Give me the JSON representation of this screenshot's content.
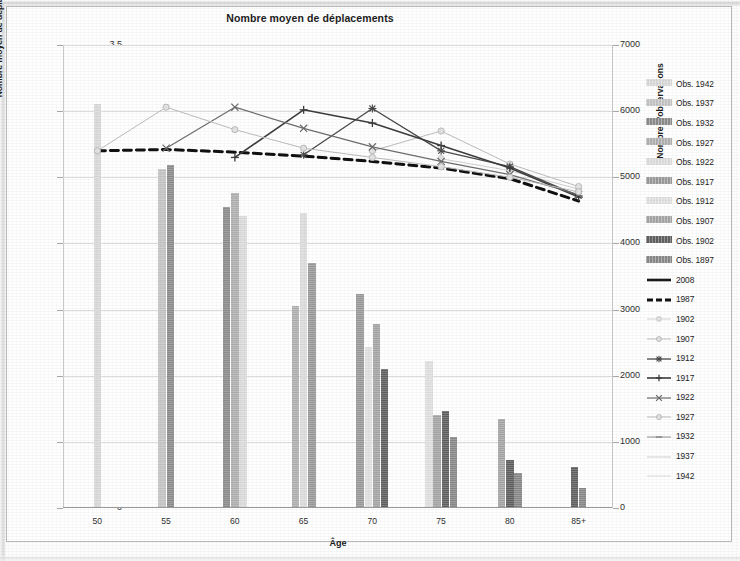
{
  "chart_data": {
    "type": "bar",
    "title": "Nombre moyen de déplacements",
    "xlabel": "Âge",
    "ylabel": "Nombre moyen de déplacements",
    "ylabel_secondary": "Nombre d'observations",
    "categories": [
      "50",
      "55",
      "60",
      "65",
      "70",
      "75",
      "80",
      "85+"
    ],
    "ylim": [
      0,
      3.5
    ],
    "yticks": [
      "0",
      "0,5",
      "1",
      "1,5",
      "2",
      "2,5",
      "3",
      "3,5"
    ],
    "ytick_values": [
      0,
      0.5,
      1,
      1.5,
      2,
      2.5,
      3,
      3.5
    ],
    "ylim_secondary": [
      0,
      7000
    ],
    "yticks_secondary": [
      "0",
      "1000",
      "2000",
      "3000",
      "4000",
      "5000",
      "6000",
      "7000"
    ],
    "ytick_values_secondary": [
      0,
      1000,
      2000,
      3000,
      4000,
      5000,
      6000,
      7000
    ],
    "grid": true,
    "legend_position": "right",
    "bar_axis": "secondary",
    "line_axis": "primary",
    "bar_series": [
      {
        "name": "Obs. 1942",
        "color": "#d9d9d9",
        "values": [
          6110,
          null,
          null,
          null,
          null,
          null,
          null,
          null
        ]
      },
      {
        "name": "Obs. 1937",
        "color": "#c4c4c4",
        "values": [
          null,
          5130,
          null,
          null,
          null,
          null,
          null,
          null
        ]
      },
      {
        "name": "Obs. 1932",
        "color": "#8c8c8c",
        "values": [
          null,
          5190,
          4550,
          null,
          null,
          null,
          null,
          null
        ]
      },
      {
        "name": "Obs. 1927",
        "color": "#b0b0b0",
        "values": [
          null,
          null,
          4760,
          3050,
          null,
          null,
          null,
          null
        ]
      },
      {
        "name": "Obs. 1922",
        "color": "#dcdcdc",
        "values": [
          null,
          null,
          4410,
          4460,
          null,
          null,
          null,
          null
        ]
      },
      {
        "name": "Obs. 1917",
        "color": "#9a9a9a",
        "values": [
          null,
          null,
          null,
          3700,
          3230,
          null,
          null,
          null
        ]
      },
      {
        "name": "Obs. 1912",
        "color": "#e0e0e0",
        "values": [
          null,
          null,
          null,
          null,
          2430,
          2220,
          null,
          null
        ]
      },
      {
        "name": "Obs. 1907",
        "color": "#a5a5a5",
        "values": [
          null,
          null,
          null,
          null,
          2780,
          1400,
          1340,
          null
        ]
      },
      {
        "name": "Obs. 1902",
        "color": "#5f5f5f",
        "values": [
          null,
          null,
          null,
          null,
          2100,
          1470,
          720,
          620
        ]
      },
      {
        "name": "Obs. 1897",
        "color": "#888888",
        "values": [
          null,
          null,
          null,
          null,
          null,
          1080,
          530,
          300
        ]
      }
    ],
    "line_series": [
      {
        "name": "2008",
        "color": "#1a1a1a",
        "style": "solid",
        "width": 2.4,
        "marker": "none",
        "values": [
          null,
          null,
          null,
          null,
          null,
          null,
          null,
          null
        ]
      },
      {
        "name": "1987",
        "color": "#111111",
        "style": "dashed",
        "width": 3.0,
        "marker": "none",
        "values": [
          2.7,
          2.71,
          2.69,
          2.66,
          2.62,
          2.57,
          2.49,
          2.32
        ]
      },
      {
        "name": "1902",
        "color": "#d0d0d0",
        "style": "solid",
        "width": 1.0,
        "marker": "circle",
        "values": [
          null,
          null,
          null,
          null,
          null,
          2.64,
          2.55,
          2.41
        ]
      },
      {
        "name": "1907",
        "color": "#bdbdbd",
        "style": "solid",
        "width": 1.0,
        "marker": "circle",
        "values": [
          null,
          null,
          null,
          null,
          2.7,
          2.85,
          2.6,
          2.43
        ]
      },
      {
        "name": "1912",
        "color": "#4a4a4a",
        "style": "solid",
        "width": 1.3,
        "marker": "star",
        "values": [
          null,
          null,
          null,
          2.67,
          3.02,
          2.7,
          2.58,
          2.36
        ]
      },
      {
        "name": "1917",
        "color": "#3d3d3d",
        "style": "solid",
        "width": 1.6,
        "marker": "plus",
        "values": [
          null,
          null,
          2.65,
          3.01,
          2.91,
          2.74,
          2.57,
          2.35
        ]
      },
      {
        "name": "1922",
        "color": "#6e6e6e",
        "style": "solid",
        "width": 1.2,
        "marker": "x",
        "values": [
          null,
          2.72,
          3.03,
          2.87,
          2.73,
          2.62,
          2.52,
          2.37
        ]
      },
      {
        "name": "1927",
        "color": "#bcbcbc",
        "style": "solid",
        "width": 1.0,
        "marker": "circle",
        "values": [
          2.7,
          3.03,
          2.86,
          2.72,
          2.65,
          2.58,
          2.5,
          2.39
        ]
      },
      {
        "name": "1932",
        "color": "#8f8f8f",
        "style": "solid",
        "width": 1.0,
        "marker": "dash",
        "values": [
          null,
          null,
          null,
          null,
          null,
          null,
          null,
          null
        ]
      },
      {
        "name": "1937",
        "color": "#cfcfcf",
        "style": "solid",
        "width": 1.0,
        "marker": "none",
        "values": [
          null,
          null,
          null,
          null,
          null,
          null,
          null,
          null
        ]
      },
      {
        "name": "1942",
        "color": "#dadada",
        "style": "solid",
        "width": 1.0,
        "marker": "none",
        "values": [
          null,
          null,
          null,
          null,
          null,
          null,
          null,
          null
        ]
      }
    ]
  },
  "legend": {
    "items": [
      {
        "label": "Obs. 1942",
        "type": "bar",
        "color": "#d9d9d9"
      },
      {
        "label": "Obs. 1937",
        "type": "bar",
        "color": "#c4c4c4"
      },
      {
        "label": "Obs. 1932",
        "type": "bar",
        "color": "#8c8c8c"
      },
      {
        "label": "Obs. 1927",
        "type": "bar",
        "color": "#b0b0b0"
      },
      {
        "label": "Obs. 1922",
        "type": "bar",
        "color": "#dcdcdc"
      },
      {
        "label": "Obs. 1917",
        "type": "bar",
        "color": "#9a9a9a"
      },
      {
        "label": "Obs. 1912",
        "type": "bar",
        "color": "#e0e0e0"
      },
      {
        "label": "Obs. 1907",
        "type": "bar",
        "color": "#a5a5a5"
      },
      {
        "label": "Obs. 1902",
        "type": "bar",
        "color": "#5f5f5f"
      },
      {
        "label": "Obs. 1897",
        "type": "bar",
        "color": "#888888"
      },
      {
        "label": "2008",
        "type": "line-solid",
        "color": "#1a1a1a",
        "width": 2.6,
        "marker": "none"
      },
      {
        "label": "1987",
        "type": "line-dashed",
        "color": "#111111",
        "width": 3.0,
        "marker": "none"
      },
      {
        "label": "1902",
        "type": "line-solid",
        "color": "#d0d0d0",
        "width": 1.0,
        "marker": "circle"
      },
      {
        "label": "1907",
        "type": "line-solid",
        "color": "#bdbdbd",
        "width": 1.0,
        "marker": "circle"
      },
      {
        "label": "1912",
        "type": "line-solid",
        "color": "#4a4a4a",
        "width": 1.3,
        "marker": "star"
      },
      {
        "label": "1917",
        "type": "line-solid",
        "color": "#3d3d3d",
        "width": 1.6,
        "marker": "plus"
      },
      {
        "label": "1922",
        "type": "line-solid",
        "color": "#6e6e6e",
        "width": 1.2,
        "marker": "x"
      },
      {
        "label": "1927",
        "type": "line-solid",
        "color": "#bcbcbc",
        "width": 1.0,
        "marker": "circle"
      },
      {
        "label": "1932",
        "type": "line-solid",
        "color": "#8f8f8f",
        "width": 1.0,
        "marker": "dash"
      },
      {
        "label": "1937",
        "type": "line-solid",
        "color": "#cfcfcf",
        "width": 1.0,
        "marker": "none"
      },
      {
        "label": "1942",
        "type": "line-solid",
        "color": "#dadada",
        "width": 1.0,
        "marker": "none"
      }
    ]
  }
}
